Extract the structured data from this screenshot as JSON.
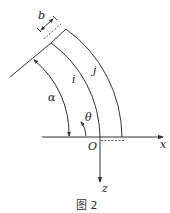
{
  "diagram": {
    "caption": "图 2",
    "labels": {
      "width": "b",
      "inner_arc": "i",
      "outer_arc": "j",
      "angle_alpha": "α",
      "angle_theta": "θ",
      "origin": "O",
      "x_axis": "x",
      "z_axis": "z"
    },
    "colors": {
      "stroke": "#333333",
      "background": "#ffffff"
    }
  }
}
